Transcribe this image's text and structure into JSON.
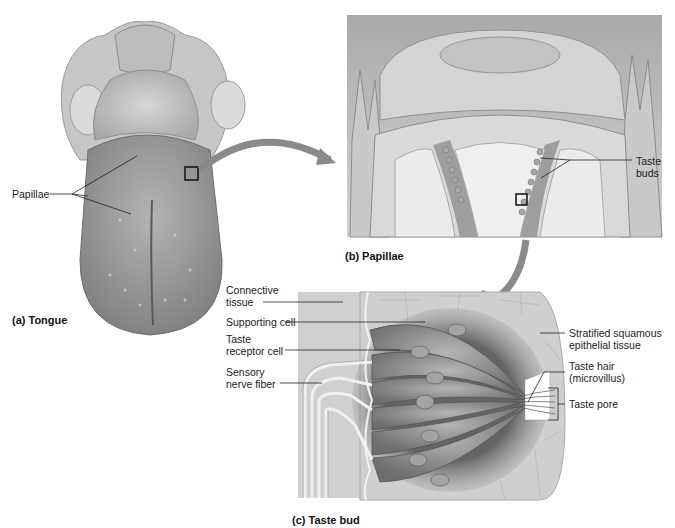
{
  "figure": {
    "panels": [
      {
        "id": "a",
        "caption": "(a) Tongue"
      },
      {
        "id": "b",
        "caption": "(b) Papillae"
      },
      {
        "id": "c",
        "caption": "(c) Taste bud"
      }
    ],
    "labels": {
      "papillae": "Papillae",
      "taste_buds_line1": "Taste",
      "taste_buds_line2": "buds",
      "connective_line1": "Connective",
      "connective_line2": "tissue",
      "supporting_cell": "Supporting cell",
      "receptor_line1": "Taste",
      "receptor_line2": "receptor cell",
      "sensory_line1": "Sensory",
      "sensory_line2": "nerve fiber",
      "stratified_line1": "Stratified squamous",
      "stratified_line2": "epithelial tissue",
      "taste_hair_line1": "Taste hair",
      "taste_hair_line2": "(microvillus)",
      "taste_pore": "Taste pore"
    },
    "colors": {
      "background": "#ffffff",
      "tissue_gray": "#9a9a9a",
      "arrow_gray": "#8a8a8a",
      "leader_line": "#222222"
    }
  }
}
